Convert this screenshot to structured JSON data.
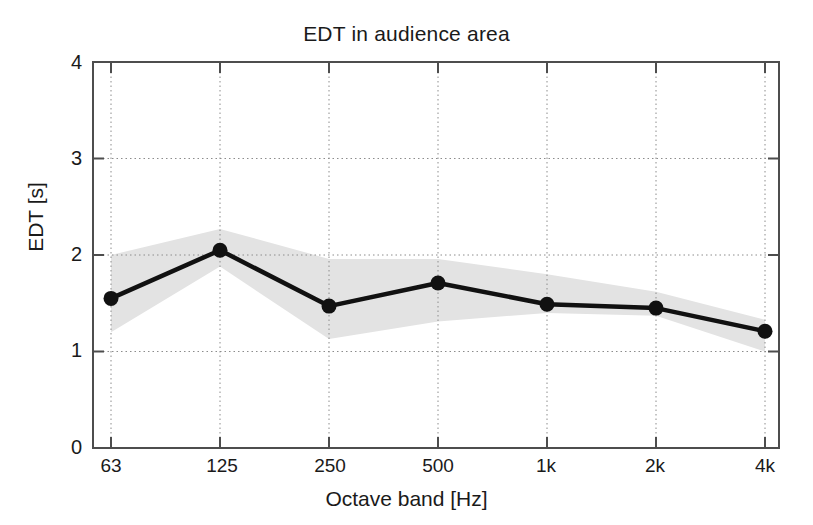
{
  "chart_data": {
    "type": "line",
    "title": "EDT in audience area",
    "xlabel": "Octave band [Hz]",
    "ylabel": "EDT [s]",
    "categories": [
      "63",
      "125",
      "250",
      "500",
      "1k",
      "2k",
      "4k"
    ],
    "values": [
      1.55,
      2.05,
      1.47,
      1.71,
      1.49,
      1.45,
      1.21
    ],
    "series": [
      {
        "name": "EDT mean",
        "values": [
          1.55,
          2.05,
          1.47,
          1.71,
          1.49,
          1.45,
          1.21
        ],
        "marker": "filled-circle",
        "color": "#000000"
      },
      {
        "name": "EDT spread band upper",
        "values": [
          2.0,
          2.27,
          1.96,
          1.96,
          1.8,
          1.62,
          1.33
        ],
        "color": "#e0e0e0"
      },
      {
        "name": "EDT spread band lower",
        "values": [
          1.2,
          1.88,
          1.13,
          1.31,
          1.4,
          1.37,
          1.0
        ],
        "color": "#e0e0e0"
      }
    ],
    "ylim": [
      0,
      4
    ],
    "yticks": [
      "0",
      "1",
      "2",
      "3",
      "4"
    ],
    "ytick_values": [
      0,
      1,
      2,
      3,
      4
    ],
    "xticks": [
      "63",
      "125",
      "250",
      "500",
      "1k",
      "2k",
      "4k"
    ],
    "grid": true,
    "grid_style": "dotted",
    "legend": "none",
    "band_color": "#e3e3e3",
    "line_color": "#111111",
    "axis_color": "#555555",
    "text_color": "#1a1a1a"
  }
}
